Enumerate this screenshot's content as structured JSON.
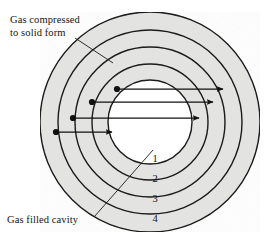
{
  "figure": {
    "background_color": "#ffffff",
    "ring_fill_color": "#e3e3e1",
    "cavity_fill_color": "#ffffff",
    "stroke_color": "#1a1a1a",
    "arrow_color": "#111111"
  },
  "labels": {
    "compressed": {
      "line1": "Gas compressed",
      "line2": "to solid form"
    },
    "cavity": {
      "text": "Gas filled cavity"
    }
  },
  "ring_numbers": [
    {
      "id": "ring-1",
      "label": "1"
    },
    {
      "id": "ring-2",
      "label": "2"
    },
    {
      "id": "ring-3",
      "label": "3"
    },
    {
      "id": "ring-4",
      "label": "4"
    }
  ],
  "geometry": {
    "center_x": 150,
    "center_y": 122,
    "radii": [
      42,
      58,
      75,
      92,
      110
    ]
  },
  "arrows": [
    {
      "id": "arrow-1",
      "start_x": 117,
      "end_x": 223,
      "y": 89
    },
    {
      "id": "arrow-2",
      "start_x": 92,
      "end_x": 213,
      "y": 102
    },
    {
      "id": "arrow-3",
      "start_x": 73,
      "end_x": 199,
      "y": 118
    },
    {
      "id": "arrow-4",
      "start_x": 56,
      "end_x": 112,
      "y": 132
    }
  ]
}
